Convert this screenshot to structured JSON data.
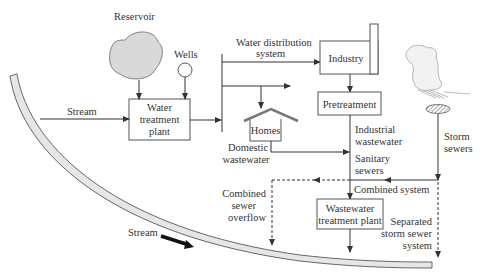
{
  "nodes": {
    "reservoir": "Reservoir",
    "wells": "Wells",
    "water_treatment_plant": [
      "Water",
      "treatment",
      "plant"
    ],
    "water_distribution": [
      "Water distribution",
      "system"
    ],
    "industry": "Industry",
    "pretreatment": "Pretreatment",
    "homes": "Homes",
    "wastewater_treatment_plant": [
      "Wastewater",
      "treatment plant"
    ]
  },
  "labels": {
    "stream_in": "Stream",
    "stream_flow": "Stream",
    "domestic_wastewater": [
      "Domestic",
      "wastewater"
    ],
    "industrial_wastewater": [
      "Industrial",
      "wastewater"
    ],
    "sanitary_sewers": [
      "Sanitary",
      "sewers"
    ],
    "storm_sewers": [
      "Storm",
      "sewers"
    ],
    "combined_system": "Combined system",
    "combined_sewer_overflow": [
      "Combined",
      "sewer",
      "overflow"
    ],
    "separated_storm_sewer": [
      "Separated",
      "storm sewer",
      "system"
    ]
  },
  "colors": {
    "stream_fill": "#e6e6e6",
    "cloud_fill": "#d9d9d9",
    "line": "#333333"
  }
}
